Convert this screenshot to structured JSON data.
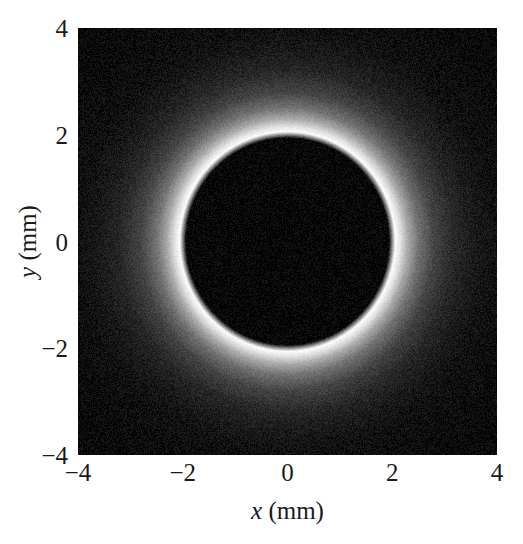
{
  "chart_data": {
    "type": "heatmap",
    "title": "",
    "subtitle": "",
    "xlabel_var": "x",
    "xlabel_unit": "(mm)",
    "ylabel_var": "y",
    "ylabel_unit": "(mm)",
    "xlabel": "x (mm)",
    "ylabel": "y (mm)",
    "xlim": [
      -4,
      4
    ],
    "ylim": [
      -4,
      4
    ],
    "xticks": [
      "−4",
      "−2",
      "0",
      "2",
      "4"
    ],
    "xtick_values": [
      -4,
      -2,
      0,
      2,
      4
    ],
    "yticks": [
      "4",
      "2",
      "0",
      "−2",
      "−4"
    ],
    "ytick_values": [
      4,
      2,
      0,
      -2,
      -4
    ],
    "grid": false,
    "legend": "none",
    "colormap": "gray",
    "colormap_low": "#000000",
    "colormap_high": "#ffffff",
    "background_color": "#ffffff",
    "features": {
      "disk_center_x": 0,
      "disk_center_y": 0,
      "disk_radius_mm": 2.0,
      "disk_intensity": 0.02,
      "halo_peak_radius_mm": 2.05,
      "halo_peak_intensity": 1.0,
      "halo_decay_length_mm": 0.55,
      "background_intensity": 0.03,
      "noise_amplitude": 0.06
    },
    "radial_profile": {
      "r_mm": [
        0.0,
        0.5,
        1.0,
        1.5,
        1.9,
        2.0,
        2.05,
        2.15,
        2.3,
        2.5,
        2.8,
        3.2,
        3.6,
        4.0,
        4.5,
        5.0,
        5.6
      ],
      "intensity": [
        0.02,
        0.02,
        0.02,
        0.02,
        0.03,
        0.45,
        1.0,
        0.88,
        0.64,
        0.42,
        0.24,
        0.13,
        0.08,
        0.05,
        0.04,
        0.03,
        0.03
      ]
    }
  },
  "axes": {
    "x_tick_labels": [
      "−4",
      "−2",
      "0",
      "2",
      "4"
    ],
    "y_tick_labels": [
      "4",
      "2",
      "0",
      "−2",
      "−4"
    ]
  }
}
